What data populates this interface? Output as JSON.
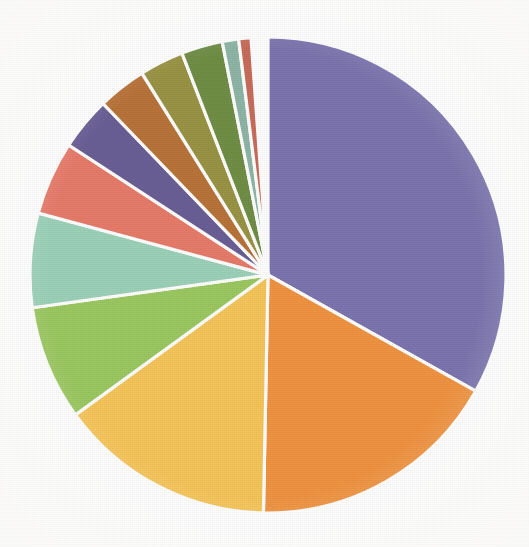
{
  "chart_data": {
    "type": "pie",
    "title": "",
    "subtitle": "",
    "xlabel": "",
    "ylabel": "",
    "grid": false,
    "legend": "none",
    "start_angle_deg": 0,
    "direction": "clockwise",
    "units": "percent",
    "center": {
      "x": 268,
      "y": 275
    },
    "radius": 238,
    "background_color": "#ffffff",
    "slice_border_color": "#ffffff",
    "slice_border_width": 3.2,
    "categories": [
      "Slice 1",
      "Slice 2",
      "Slice 3",
      "Slice 4",
      "Slice 5",
      "Slice 6",
      "Slice 7",
      "Slice 8",
      "Slice 9",
      "Slice 10",
      "Slice 11",
      "Slice 12"
    ],
    "values": [
      33.1,
      17.2,
      14.7,
      7.8,
      6.4,
      5.0,
      3.6,
      3.3,
      3.0,
      2.8,
      1.1,
      0.8
    ],
    "angles_deg": [
      119.2,
      61.9,
      52.9,
      28.1,
      23.0,
      18.0,
      13.0,
      11.9,
      10.8,
      10.1,
      4.0,
      3.0
    ],
    "colors": [
      "#7d76b0",
      "#f09442",
      "#f6c65b",
      "#9cc962",
      "#9dd2b9",
      "#e87c6b",
      "#6b6096",
      "#b9743a",
      "#9a9445",
      "#718f47",
      "#8fb6a6",
      "#c96d5c"
    ],
    "slices": [
      {
        "label": "Slice 1",
        "value": 33.1,
        "angle_deg": 119.2,
        "color": "#7d76b0",
        "color_name": "slate-purple"
      },
      {
        "label": "Slice 2",
        "value": 17.2,
        "angle_deg": 61.9,
        "color": "#f09442",
        "color_name": "orange"
      },
      {
        "label": "Slice 3",
        "value": 14.7,
        "angle_deg": 52.9,
        "color": "#f6c65b",
        "color_name": "gold-yellow"
      },
      {
        "label": "Slice 4",
        "value": 7.8,
        "angle_deg": 28.1,
        "color": "#9cc962",
        "color_name": "light-green"
      },
      {
        "label": "Slice 5",
        "value": 6.4,
        "angle_deg": 23.0,
        "color": "#9dd2b9",
        "color_name": "sea-green"
      },
      {
        "label": "Slice 6",
        "value": 5.0,
        "angle_deg": 18.0,
        "color": "#e87c6b",
        "color_name": "salmon-red"
      },
      {
        "label": "Slice 7",
        "value": 3.6,
        "angle_deg": 13.0,
        "color": "#6b6096",
        "color_name": "dark-purple"
      },
      {
        "label": "Slice 8",
        "value": 3.3,
        "angle_deg": 11.9,
        "color": "#b9743a",
        "color_name": "sienna-brown"
      },
      {
        "label": "Slice 9",
        "value": 3.0,
        "angle_deg": 10.8,
        "color": "#9a9445",
        "color_name": "olive-yellow"
      },
      {
        "label": "Slice 10",
        "value": 2.8,
        "angle_deg": 10.1,
        "color": "#718f47",
        "color_name": "olive-green"
      },
      {
        "label": "Slice 11",
        "value": 1.1,
        "angle_deg": 4.0,
        "color": "#8fb6a6",
        "color_name": "pale-teal"
      },
      {
        "label": "Slice 12",
        "value": 0.8,
        "angle_deg": 3.0,
        "color": "#c96d5c",
        "color_name": "brick-red"
      }
    ]
  },
  "figure": {
    "alt_text": "Pie chart with twelve unlabeled slices"
  }
}
